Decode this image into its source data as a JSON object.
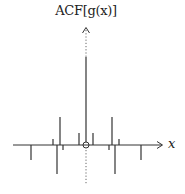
{
  "chart_data": {
    "type": "stem",
    "title": "",
    "ylabel": "ACF[g(x)]",
    "xlabel": "x",
    "grid": false,
    "axis": {
      "origin_marker": "circle",
      "vertical_axis_style": "dotted",
      "arrows": [
        "up",
        "right"
      ]
    },
    "stems": [
      {
        "x": -55,
        "y": -15
      },
      {
        "x": -33,
        "y": 6
      },
      {
        "x": -29,
        "y": -29
      },
      {
        "x": -26,
        "y": 28
      },
      {
        "x": -23,
        "y": -5
      },
      {
        "x": -7,
        "y": 12
      },
      {
        "x": 0,
        "y": 88
      },
      {
        "x": 7,
        "y": 12
      },
      {
        "x": 23,
        "y": -5
      },
      {
        "x": 26,
        "y": 28
      },
      {
        "x": 29,
        "y": -29
      },
      {
        "x": 33,
        "y": 6
      },
      {
        "x": 55,
        "y": -15
      }
    ],
    "units_note": "pixel-relative amplitudes; no tick labels shown"
  },
  "labels": {
    "y_axis": "ACF[g(x)]",
    "x_axis": "x"
  },
  "colors": {
    "stroke": "#333333",
    "background": "#ffffff"
  }
}
